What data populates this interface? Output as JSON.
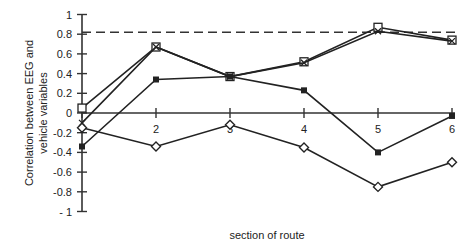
{
  "chart_data": {
    "type": "line",
    "title": "",
    "xlabel": "section of route",
    "ylabel": "Correlation between EEG and vehicle variables",
    "ylabel_lines": [
      "Correlation between EEG and",
      "vehicle  variables"
    ],
    "x": [
      1,
      2,
      3,
      4,
      5,
      6
    ],
    "x_tick_labels": [
      "1",
      "2",
      "3",
      "4",
      "5",
      "6"
    ],
    "y_tick_labels": [
      "1",
      "0.8",
      "0.6",
      "0.4",
      "0.2",
      "0",
      "-0.2",
      "-0.4",
      "-0.6",
      "-0.8",
      "- 1"
    ],
    "y_ticks": [
      1,
      0.8,
      0.6,
      0.4,
      0.2,
      0,
      -0.2,
      -0.4,
      -0.6,
      -0.8,
      -1
    ],
    "ylim": [
      -1,
      1
    ],
    "xlim": [
      1,
      6
    ],
    "grid": false,
    "legend": null,
    "reference_line": {
      "y": 0.82,
      "style": "dashed"
    },
    "series": [
      {
        "name": "open square",
        "marker": "open-square",
        "values": [
          0.05,
          0.67,
          0.37,
          0.52,
          0.87,
          0.74
        ]
      },
      {
        "name": "cross",
        "marker": "cross",
        "values": [
          -0.1,
          0.67,
          0.37,
          0.51,
          0.83,
          0.73
        ]
      },
      {
        "name": "filled square",
        "marker": "filled-square",
        "values": [
          -0.34,
          0.34,
          0.37,
          0.23,
          -0.4,
          -0.03
        ]
      },
      {
        "name": "open diamond",
        "marker": "open-diamond",
        "values": [
          -0.15,
          -0.34,
          -0.12,
          -0.35,
          -0.75,
          -0.5
        ]
      }
    ]
  }
}
